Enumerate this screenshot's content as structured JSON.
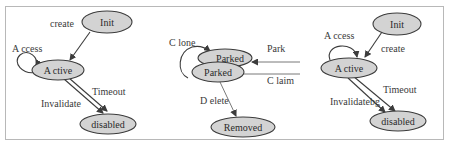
{
  "diagram": {
    "left": {
      "nodes": {
        "init": "Init",
        "active": "A ctive",
        "disabled": "disabled"
      },
      "edges": {
        "create": "create",
        "access": "A ccess",
        "invalidate": "Invalidate",
        "timeout": "Timeout"
      }
    },
    "middle": {
      "nodes": {
        "parked_back": "Parked",
        "parked_front": "Parked",
        "removed": "Removed"
      },
      "edges": {
        "clone": "C lone",
        "park": "Park",
        "claim": "C laim",
        "delete": "D elete"
      }
    },
    "right": {
      "nodes": {
        "init": "Init",
        "active": "A ctive",
        "disabled": "disabled"
      },
      "edges": {
        "access": "A ccess",
        "create": "create",
        "invalidate": "Invalidatebg",
        "timeout": "Timeout"
      }
    },
    "colors": {
      "node_fill": "#d3d3d3",
      "stroke": "#3c3c3c",
      "frame": "#b8b8b8",
      "text": "#3a3a3a"
    }
  }
}
